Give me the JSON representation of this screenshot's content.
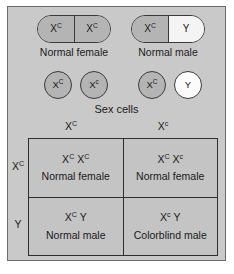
{
  "figure": {
    "type": "punnett-square",
    "topic": "X-linked colorblindness inheritance"
  },
  "parents": [
    {
      "name": "female-parent",
      "alleles": [
        {
          "symbol": "X",
          "superscript": "C",
          "shaded": true
        },
        {
          "symbol": "X",
          "superscript": "C",
          "shaded": true
        }
      ],
      "label": "Normal female"
    },
    {
      "name": "male-parent",
      "alleles": [
        {
          "symbol": "X",
          "superscript": "C",
          "shaded": true
        },
        {
          "symbol": "Y",
          "superscript": "",
          "shaded": false
        }
      ],
      "label": "Normal male"
    }
  ],
  "gametes": {
    "label": "Sex cells",
    "cells": [
      {
        "symbol": "X",
        "superscript": "C",
        "shaded": true
      },
      {
        "symbol": "X",
        "superscript": "c",
        "shaded": true
      },
      {
        "symbol": "X",
        "superscript": "C",
        "shaded": true
      },
      {
        "symbol": "Y",
        "superscript": "",
        "shaded": false
      }
    ]
  },
  "punnett": {
    "column_headers": [
      {
        "symbol": "X",
        "superscript": "C"
      },
      {
        "symbol": "X",
        "superscript": "c"
      }
    ],
    "row_headers": [
      {
        "symbol": "X",
        "superscript": "C"
      },
      {
        "symbol": "Y",
        "superscript": ""
      }
    ],
    "cells": [
      {
        "genotype": [
          {
            "symbol": "X",
            "superscript": "C"
          },
          {
            "symbol": "X",
            "superscript": "C"
          }
        ],
        "phenotype": "Normal female"
      },
      {
        "genotype": [
          {
            "symbol": "X",
            "superscript": "C"
          },
          {
            "symbol": "X",
            "superscript": "c"
          }
        ],
        "phenotype": "Normal female"
      },
      {
        "genotype": [
          {
            "symbol": "X",
            "superscript": "C"
          },
          {
            "symbol": "Y",
            "superscript": ""
          }
        ],
        "phenotype": "Normal male"
      },
      {
        "genotype": [
          {
            "symbol": "X",
            "superscript": "c"
          },
          {
            "symbol": "Y",
            "superscript": ""
          }
        ],
        "phenotype": "Colorblind male"
      }
    ]
  },
  "colors": {
    "figure_background": "#c9c9c9",
    "cell_background": "#c4c4c4",
    "shaded_allele": "#b4b4b4",
    "light_allele": "#f4f4f4",
    "border": "#2e2e2e",
    "text": "#1a1a1a"
  }
}
